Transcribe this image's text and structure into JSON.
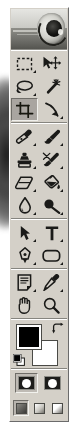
{
  "app": {
    "name": "Adobe Photoshop Toolbox",
    "logo_alt": "photoshop-eye-logo"
  },
  "toolbox": {
    "selected_tool": "crop-tool",
    "groups": [
      {
        "name": "selection-tools",
        "rows": [
          [
            {
              "id": "rectangular-marquee-tool",
              "label": "Rectangular Marquee Tool",
              "shortcut": "M",
              "icon": "marquee-icon",
              "has_flyout": true,
              "selected": false
            },
            {
              "id": "move-tool",
              "label": "Move Tool",
              "shortcut": "V",
              "icon": "move-icon",
              "has_flyout": false,
              "selected": false
            }
          ],
          [
            {
              "id": "lasso-tool",
              "label": "Lasso Tool",
              "shortcut": "L",
              "icon": "lasso-icon",
              "has_flyout": true,
              "selected": false
            },
            {
              "id": "magic-wand-tool",
              "label": "Magic Wand Tool",
              "shortcut": "W",
              "icon": "magic-wand-icon",
              "has_flyout": false,
              "selected": false
            }
          ],
          [
            {
              "id": "crop-tool",
              "label": "Crop Tool",
              "shortcut": "C",
              "icon": "crop-icon",
              "has_flyout": false,
              "selected": true
            },
            {
              "id": "slice-tool",
              "label": "Slice Tool",
              "shortcut": "K",
              "icon": "slice-icon",
              "has_flyout": true,
              "selected": false
            }
          ]
        ]
      },
      {
        "name": "retouch-paint-tools",
        "rows": [
          [
            {
              "id": "healing-brush-tool",
              "label": "Healing Brush Tool",
              "shortcut": "J",
              "icon": "healing-brush-icon",
              "has_flyout": true,
              "selected": false
            },
            {
              "id": "brush-tool",
              "label": "Brush Tool",
              "shortcut": "B",
              "icon": "paintbrush-icon",
              "has_flyout": true,
              "selected": false
            }
          ],
          [
            {
              "id": "clone-stamp-tool",
              "label": "Clone Stamp Tool",
              "shortcut": "S",
              "icon": "stamp-icon",
              "has_flyout": true,
              "selected": false
            },
            {
              "id": "history-brush-tool",
              "label": "History Brush Tool",
              "shortcut": "Y",
              "icon": "history-brush-icon",
              "has_flyout": true,
              "selected": false
            }
          ],
          [
            {
              "id": "eraser-tool",
              "label": "Eraser Tool",
              "shortcut": "E",
              "icon": "eraser-icon",
              "has_flyout": true,
              "selected": false
            },
            {
              "id": "gradient-tool",
              "label": "Paint Bucket Tool",
              "shortcut": "G",
              "icon": "paint-bucket-icon",
              "has_flyout": true,
              "selected": false
            }
          ],
          [
            {
              "id": "blur-tool",
              "label": "Blur Tool",
              "shortcut": "R",
              "icon": "waterdrop-icon",
              "has_flyout": true,
              "selected": false
            },
            {
              "id": "dodge-tool",
              "label": "Dodge Tool",
              "shortcut": "O",
              "icon": "dodge-icon",
              "has_flyout": true,
              "selected": false
            }
          ]
        ]
      },
      {
        "name": "vector-type-tools",
        "rows": [
          [
            {
              "id": "path-selection-tool",
              "label": "Path Selection Tool",
              "shortcut": "A",
              "icon": "black-arrow-icon",
              "has_flyout": true,
              "selected": false
            },
            {
              "id": "type-tool",
              "label": "Horizontal Type Tool",
              "shortcut": "T",
              "icon": "type-t-icon",
              "has_flyout": true,
              "selected": false
            }
          ],
          [
            {
              "id": "pen-tool",
              "label": "Pen Tool",
              "shortcut": "P",
              "icon": "pen-nib-icon",
              "has_flyout": true,
              "selected": false
            },
            {
              "id": "rounded-rectangle-tool",
              "label": "Rounded Rectangle Tool",
              "shortcut": "U",
              "icon": "rounded-rectangle-icon",
              "has_flyout": true,
              "selected": false
            }
          ]
        ]
      },
      {
        "name": "annotation-navigation-tools",
        "rows": [
          [
            {
              "id": "notes-tool",
              "label": "Notes Tool",
              "shortcut": "N",
              "icon": "notes-page-icon",
              "has_flyout": true,
              "selected": false
            },
            {
              "id": "eyedropper-tool",
              "label": "Eyedropper Tool",
              "shortcut": "I",
              "icon": "eyedropper-icon",
              "has_flyout": true,
              "selected": false
            }
          ],
          [
            {
              "id": "hand-tool",
              "label": "Hand Tool",
              "shortcut": "H",
              "icon": "hand-icon",
              "has_flyout": false,
              "selected": false
            },
            {
              "id": "zoom-tool",
              "label": "Zoom Tool",
              "shortcut": "Z",
              "icon": "magnifier-icon",
              "has_flyout": false,
              "selected": false
            }
          ]
        ]
      }
    ]
  },
  "colors": {
    "foreground_label": "Set foreground color",
    "background_label": "Set background color",
    "foreground": "#000000",
    "background": "#FFFFFF",
    "swap_label": "Switch Foreground and Background Colors",
    "default_label": "Default Foreground and Background Colors"
  },
  "mask_modes": {
    "items": [
      {
        "id": "standard-mode",
        "label": "Edit in Standard Mode",
        "selected": true
      },
      {
        "id": "quick-mask-mode",
        "label": "Edit in Quick Mask Mode",
        "selected": false
      }
    ]
  },
  "screen_modes": {
    "items": [
      {
        "id": "standard-screen-mode",
        "label": "Standard Screen Mode",
        "selected": true
      },
      {
        "id": "full-screen-with-menu-bar",
        "label": "Full Screen Mode With Menu Bar",
        "selected": false
      },
      {
        "id": "full-screen-mode",
        "label": "Full Screen Mode",
        "selected": false
      }
    ]
  }
}
